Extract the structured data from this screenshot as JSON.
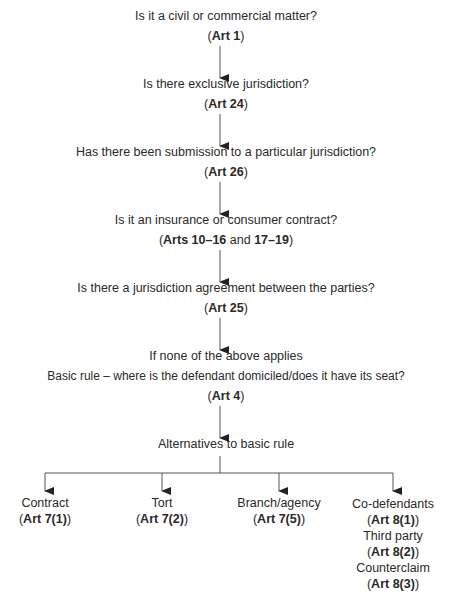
{
  "flowchart": {
    "nodes": [
      {
        "question": "Is it a civil or commercial matter?",
        "ref_open": "(",
        "ref_bold": "Art 1",
        "ref_close": ")"
      },
      {
        "question": "Is there exclusive jurisdiction?",
        "ref_open": "(",
        "ref_bold": "Art 24",
        "ref_close": ")"
      },
      {
        "question": "Has there been submission to a particular jurisdiction?",
        "ref_open": "(",
        "ref_bold": "Art 26",
        "ref_close": ")"
      },
      {
        "question": "Is it an insurance or consumer contract?",
        "ref_open": "(",
        "ref_bold": "Arts 10–16",
        "ref_mid": " and ",
        "ref_bold2": "17–19",
        "ref_close": ")"
      },
      {
        "question": "Is there a jurisdiction agreement between the parties?",
        "ref_open": "(",
        "ref_bold": "Art 25",
        "ref_close": ")"
      },
      {
        "line1": "If none of the above applies",
        "question": "Basic rule – where is the defendant domiciled/does it have its seat?",
        "ref_open": "(",
        "ref_bold": "Art 4",
        "ref_close": ")"
      }
    ],
    "alternatives_heading": "Alternatives to basic rule",
    "branches": [
      {
        "items": [
          {
            "label": "Contract",
            "ref_bold": "Art 7(1)"
          }
        ]
      },
      {
        "items": [
          {
            "label": "Tort",
            "ref_bold": "Art 7(2)"
          }
        ]
      },
      {
        "items": [
          {
            "label": "Branch/agency",
            "ref_bold": "Art 7(5)"
          }
        ]
      },
      {
        "items": [
          {
            "label": "Co-defendants",
            "ref_bold": "Art 8(1)"
          },
          {
            "label": "Third party",
            "ref_bold": "Art 8(2)"
          },
          {
            "label": "Counterclaim",
            "ref_bold": "Art 8(3)"
          }
        ]
      }
    ],
    "paren_open": "(",
    "paren_close": ")",
    "line_color": "#555555"
  }
}
